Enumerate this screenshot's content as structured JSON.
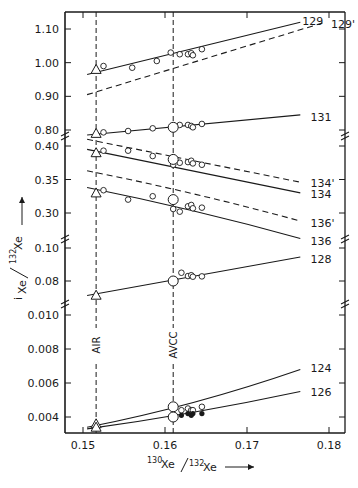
{
  "chart_data": {
    "type": "line",
    "title": "",
    "xlabel": "130Xe/132Xe",
    "xlabel_parts": {
      "sup1": "130",
      "base1": "Xe",
      "sup2": "132",
      "base2": "Xe",
      "arrow": "→"
    },
    "ylabel": "iXe/132Xe",
    "ylabel_parts": {
      "sup_i": "i",
      "base1": "Xe",
      "sup2": "132",
      "base2": "Xe",
      "arrow": "→"
    },
    "xlim": [
      0.148,
      0.182
    ],
    "x_ticks": [
      "0.15",
      "0.16",
      "0.17",
      "0.18"
    ],
    "y_axis_broken": true,
    "y_panels": [
      {
        "range": [
          0.78,
          1.12
        ],
        "ticks": [
          "0.80",
          "0.90",
          "1.00",
          "1.10"
        ]
      },
      {
        "range": [
          0.28,
          0.41
        ],
        "ticks": [
          "0.30",
          "0.35",
          "0.40"
        ]
      },
      {
        "range": [
          0.07,
          0.1
        ],
        "ticks": [
          "0.08",
          "0.10"
        ]
      },
      {
        "range": [
          0.0033,
          0.0105
        ],
        "ticks": [
          "0.004",
          "0.006",
          "0.008",
          "0.010"
        ]
      }
    ],
    "reference_lines": [
      {
        "label": "AIR",
        "x": 0.1516,
        "style": "dashed",
        "orientation": "vertical"
      },
      {
        "label": "AVCC",
        "x": 0.161,
        "style": "dashed",
        "orientation": "vertical"
      }
    ],
    "series": [
      {
        "name": "129",
        "style": "solid",
        "x": [
          0.1505,
          0.1765
        ],
        "y": [
          0.965,
          1.12
        ],
        "label_pos": [
          0.1765,
          1.125
        ]
      },
      {
        "name": "129'",
        "style": "dashed",
        "x": [
          0.1505,
          0.1795
        ],
        "y": [
          0.905,
          1.12
        ],
        "label_pos": [
          0.18,
          1.115
        ]
      },
      {
        "name": "131",
        "style": "solid",
        "x": [
          0.1505,
          0.1765
        ],
        "y": [
          0.785,
          0.845
        ],
        "label_pos": [
          0.1775,
          0.84
        ]
      },
      {
        "name": "134'",
        "style": "dashed",
        "x": [
          0.1505,
          0.1765
        ],
        "y": [
          0.41,
          0.346
        ],
        "label_pos": [
          0.1775,
          0.345
        ]
      },
      {
        "name": "134",
        "style": "solid",
        "x": [
          0.1505,
          0.1765
        ],
        "y": [
          0.395,
          0.33
        ],
        "label_pos": [
          0.1775,
          0.328
        ]
      },
      {
        "name": "136'",
        "style": "dashed",
        "x": [
          0.1505,
          0.1765
        ],
        "y": [
          0.363,
          0.288
        ],
        "label_pos": [
          0.1775,
          0.285
        ]
      },
      {
        "name": "136",
        "style": "solid",
        "x": [
          0.1505,
          0.1765
        ],
        "y": [
          0.338,
          0.262
        ],
        "label_pos": [
          0.1775,
          0.258
        ]
      },
      {
        "name": "128",
        "style": "solid",
        "x": [
          0.1505,
          0.1765
        ],
        "y": [
          0.0712,
          0.0945
        ],
        "label_pos": [
          0.1775,
          0.0935
        ]
      },
      {
        "name": "124",
        "style": "solid",
        "x": [
          0.1505,
          0.1765
        ],
        "y": [
          0.0034,
          0.0068
        ],
        "label_pos": [
          0.1775,
          0.0069
        ]
      },
      {
        "name": "126",
        "style": "solid",
        "x": [
          0.1505,
          0.1765
        ],
        "y": [
          0.0033,
          0.0055
        ],
        "label_pos": [
          0.1775,
          0.0055
        ]
      }
    ],
    "markers": {
      "triangle_air": [
        {
          "series": "129",
          "x": 0.1516,
          "y": 0.98
        },
        {
          "series": "131",
          "x": 0.1516,
          "y": 0.79
        },
        {
          "series": "134",
          "x": 0.1516,
          "y": 0.39
        },
        {
          "series": "136",
          "x": 0.1516,
          "y": 0.33
        },
        {
          "series": "128",
          "x": 0.1516,
          "y": 0.0714
        },
        {
          "series": "124",
          "x": 0.1516,
          "y": 0.0036
        },
        {
          "series": "126",
          "x": 0.1516,
          "y": 0.0034
        }
      ],
      "large_circle_avcc": [
        {
          "series": "131",
          "x": 0.161,
          "y": 0.808
        },
        {
          "series": "134'",
          "x": 0.161,
          "y": 0.38
        },
        {
          "series": "136'",
          "x": 0.161,
          "y": 0.32
        },
        {
          "series": "128",
          "x": 0.161,
          "y": 0.08
        },
        {
          "series": "124",
          "x": 0.161,
          "y": 0.0046
        },
        {
          "series": "126",
          "x": 0.161,
          "y": 0.004
        }
      ],
      "small_open_circles": [
        {
          "series": "129",
          "x": 0.1525,
          "y": 0.99
        },
        {
          "series": "129",
          "x": 0.156,
          "y": 0.985
        },
        {
          "series": "129",
          "x": 0.159,
          "y": 1.005
        },
        {
          "series": "129",
          "x": 0.1607,
          "y": 1.03
        },
        {
          "series": "129",
          "x": 0.1618,
          "y": 1.025
        },
        {
          "series": "129",
          "x": 0.1628,
          "y": 1.025
        },
        {
          "series": "129",
          "x": 0.1632,
          "y": 1.028
        },
        {
          "series": "129",
          "x": 0.1634,
          "y": 1.022
        },
        {
          "series": "129",
          "x": 0.1645,
          "y": 1.04
        },
        {
          "series": "131",
          "x": 0.1525,
          "y": 0.793
        },
        {
          "series": "131",
          "x": 0.1555,
          "y": 0.797
        },
        {
          "series": "131",
          "x": 0.1585,
          "y": 0.805
        },
        {
          "series": "131",
          "x": 0.1618,
          "y": 0.815
        },
        {
          "series": "131",
          "x": 0.1628,
          "y": 0.815
        },
        {
          "series": "131",
          "x": 0.1632,
          "y": 0.812
        },
        {
          "series": "131",
          "x": 0.1634,
          "y": 0.808
        },
        {
          "series": "131",
          "x": 0.1645,
          "y": 0.818
        },
        {
          "series": "134'",
          "x": 0.1525,
          "y": 0.393
        },
        {
          "series": "134'",
          "x": 0.1555,
          "y": 0.393
        },
        {
          "series": "134'",
          "x": 0.1585,
          "y": 0.385
        },
        {
          "series": "134'",
          "x": 0.161,
          "y": 0.372
        },
        {
          "series": "134'",
          "x": 0.1618,
          "y": 0.375
        },
        {
          "series": "134'",
          "x": 0.1628,
          "y": 0.376
        },
        {
          "series": "134'",
          "x": 0.1632,
          "y": 0.378
        },
        {
          "series": "134'",
          "x": 0.1634,
          "y": 0.374
        },
        {
          "series": "134'",
          "x": 0.1645,
          "y": 0.372
        },
        {
          "series": "136'",
          "x": 0.1525,
          "y": 0.334
        },
        {
          "series": "136'",
          "x": 0.1555,
          "y": 0.32
        },
        {
          "series": "136'",
          "x": 0.1585,
          "y": 0.325
        },
        {
          "series": "136'",
          "x": 0.161,
          "y": 0.306
        },
        {
          "series": "136'",
          "x": 0.1618,
          "y": 0.302
        },
        {
          "series": "136'",
          "x": 0.1628,
          "y": 0.31
        },
        {
          "series": "136'",
          "x": 0.1632,
          "y": 0.312
        },
        {
          "series": "136'",
          "x": 0.1634,
          "y": 0.307
        },
        {
          "series": "136'",
          "x": 0.1645,
          "y": 0.308
        },
        {
          "series": "128",
          "x": 0.162,
          "y": 0.085
        },
        {
          "series": "128",
          "x": 0.1628,
          "y": 0.083
        },
        {
          "series": "128",
          "x": 0.1632,
          "y": 0.0835
        },
        {
          "series": "128",
          "x": 0.1634,
          "y": 0.0826
        },
        {
          "series": "128",
          "x": 0.1645,
          "y": 0.0828
        },
        {
          "series": "124",
          "x": 0.162,
          "y": 0.0044
        },
        {
          "series": "124",
          "x": 0.1628,
          "y": 0.0045
        },
        {
          "series": "124",
          "x": 0.1632,
          "y": 0.0044
        },
        {
          "series": "124",
          "x": 0.1634,
          "y": 0.0044
        },
        {
          "series": "124",
          "x": 0.1645,
          "y": 0.0046
        }
      ],
      "filled_circles": [
        {
          "series": "126",
          "x": 0.1608,
          "y": 0.004
        },
        {
          "series": "126",
          "x": 0.162,
          "y": 0.0041
        },
        {
          "series": "126",
          "x": 0.1628,
          "y": 0.0042
        },
        {
          "series": "126",
          "x": 0.1632,
          "y": 0.0041
        },
        {
          "series": "126",
          "x": 0.1634,
          "y": 0.0042
        },
        {
          "series": "126",
          "x": 0.1645,
          "y": 0.0042
        }
      ]
    },
    "legend": null,
    "grid": false
  }
}
